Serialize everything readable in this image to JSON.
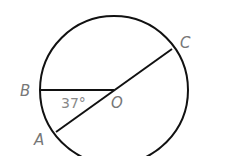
{
  "diagram": {
    "labels": {
      "B": "B",
      "O": "O",
      "C": "C",
      "A": "A"
    },
    "angle_label": "37°",
    "elements": [
      "circle with center O",
      "radius OB",
      "diameter AC through O"
    ],
    "colors": {
      "stroke": "#111111",
      "label": "#777777",
      "background": "#ffffff"
    }
  }
}
